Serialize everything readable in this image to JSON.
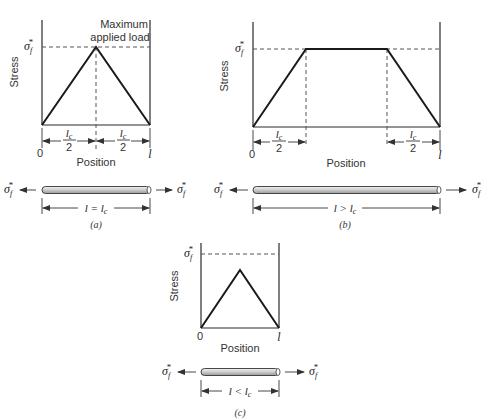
{
  "figure": {
    "axis_labels": {
      "y": "Stress",
      "x": "Position"
    },
    "sigma_label": "σ",
    "sigma_sub": "f",
    "sigma_sup": "*",
    "origin_label": "0",
    "length_label": "l",
    "lc_label": "l",
    "lc_sub": "c",
    "half_denominator": "2"
  },
  "panels": [
    {
      "id": "a",
      "caption": "(a)",
      "annotation_line1": "Maximum",
      "annotation_line2": "applied load",
      "rod_relation": "l = l",
      "rod_relation_sub": "c",
      "stress_profile": "triangle peaking at σf* at midpoint"
    },
    {
      "id": "b",
      "caption": "(b)",
      "rod_relation": "l > l",
      "rod_relation_sub": "c",
      "stress_profile": "trapezoid: linear rise over lc/2, plateau at σf*, linear fall over lc/2"
    },
    {
      "id": "c",
      "caption": "(c)",
      "rod_relation": "l < l",
      "rod_relation_sub": "c",
      "stress_profile": "triangle peaking below σf*"
    }
  ],
  "colors": {
    "line": "#1a1a1a",
    "dash": "#555555",
    "rod_fill": "#d9d9d9",
    "rod_stroke": "#333333"
  }
}
